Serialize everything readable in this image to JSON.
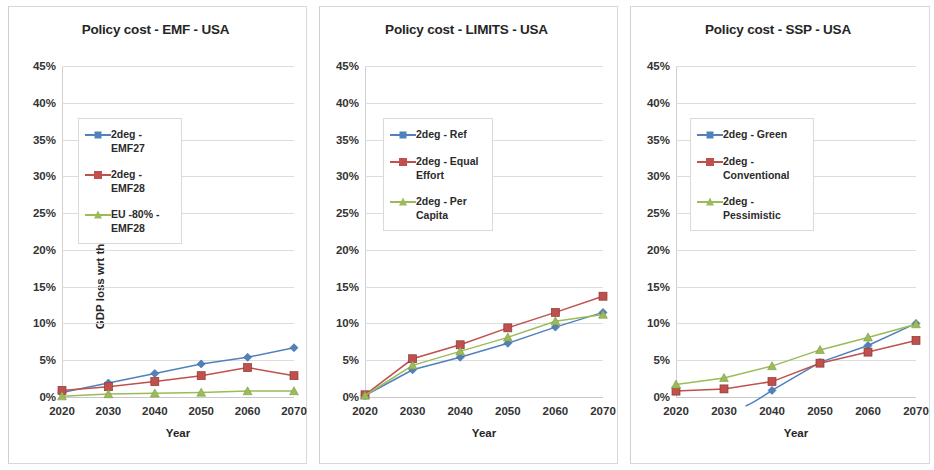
{
  "figure": {
    "panel_count": 3,
    "y_axis_title": "GDP loss wrt the relevant baseline",
    "x_axis_title": "Year",
    "colors": {
      "blue": "#4f81bd",
      "red": "#c0504d",
      "green": "#9bbb59",
      "gridline": "#dcdcdc",
      "text": "#262626"
    }
  },
  "panels": [
    {
      "title": "Policy cost - EMF - USA",
      "x_axis_title": "Year",
      "y_axis_title": "GDP loss wrt the relevant baseline",
      "y_ticks": [
        "0%",
        "5%",
        "10%",
        "15%",
        "20%",
        "25%",
        "30%",
        "35%",
        "40%",
        "45%"
      ],
      "x_ticks": [
        "2020",
        "2030",
        "2040",
        "2050",
        "2060",
        "2070"
      ],
      "legend": [
        {
          "label": "2deg - EMF27",
          "color": "#4f81bd",
          "marker": "diamond"
        },
        {
          "label": "2deg - EMF28",
          "color": "#c0504d",
          "marker": "square"
        },
        {
          "label": "EU -80% - EMF28",
          "color": "#9bbb59",
          "marker": "triangle"
        }
      ]
    },
    {
      "title": "Policy cost - LIMITS - USA",
      "x_axis_title": "Year",
      "y_ticks": [
        "0%",
        "5%",
        "10%",
        "15%",
        "20%",
        "25%",
        "30%",
        "35%",
        "40%",
        "45%"
      ],
      "x_ticks": [
        "2020",
        "2030",
        "2040",
        "2050",
        "2060",
        "2070"
      ],
      "legend": [
        {
          "label": "2deg - Ref",
          "color": "#4f81bd",
          "marker": "diamond"
        },
        {
          "label": "2deg - Equal Effort",
          "color": "#c0504d",
          "marker": "square"
        },
        {
          "label": "2deg - Per Capita",
          "color": "#9bbb59",
          "marker": "triangle"
        }
      ]
    },
    {
      "title": "Policy cost - SSP - USA",
      "x_axis_title": "Year",
      "y_ticks": [
        "0%",
        "5%",
        "10%",
        "15%",
        "20%",
        "25%",
        "30%",
        "35%",
        "40%",
        "45%"
      ],
      "x_ticks": [
        "2020",
        "2030",
        "2040",
        "2050",
        "2060",
        "2070"
      ],
      "legend": [
        {
          "label": "2deg - Green",
          "color": "#4f81bd",
          "marker": "diamond"
        },
        {
          "label": "2deg - Conventional",
          "color": "#c0504d",
          "marker": "square"
        },
        {
          "label": "2deg - Pessimistic",
          "color": "#9bbb59",
          "marker": "triangle"
        }
      ]
    }
  ],
  "chart_data": [
    {
      "type": "line",
      "title": "Policy cost - EMF - USA",
      "xlabel": "Year",
      "ylabel": "GDP loss wrt the relevant baseline",
      "x": [
        2020,
        2030,
        2040,
        2050,
        2060,
        2070
      ],
      "xlim": [
        2020,
        2070
      ],
      "ylim": [
        0,
        45
      ],
      "yticks": [
        0,
        5,
        10,
        15,
        20,
        25,
        30,
        35,
        40,
        45
      ],
      "ytick_format": "percent",
      "grid": true,
      "legend_position": "upper-left-inside",
      "series": [
        {
          "name": "2deg - EMF27",
          "color": "#4f81bd",
          "marker": "diamond",
          "values": [
            0.6,
            1.9,
            3.2,
            4.5,
            5.4,
            6.7
          ]
        },
        {
          "name": "2deg - EMF28",
          "color": "#c0504d",
          "marker": "square",
          "values": [
            0.9,
            1.4,
            2.1,
            2.9,
            4.0,
            2.9
          ]
        },
        {
          "name": "EU -80% - EMF28",
          "color": "#9bbb59",
          "marker": "triangle",
          "values": [
            0.1,
            0.4,
            0.5,
            0.6,
            0.8,
            0.8
          ]
        }
      ]
    },
    {
      "type": "line",
      "title": "Policy cost - LIMITS - USA",
      "xlabel": "Year",
      "ylabel": "GDP loss wrt the relevant baseline",
      "x": [
        2020,
        2030,
        2040,
        2050,
        2060,
        2070
      ],
      "xlim": [
        2020,
        2070
      ],
      "ylim": [
        0,
        45
      ],
      "yticks": [
        0,
        5,
        10,
        15,
        20,
        25,
        30,
        35,
        40,
        45
      ],
      "ytick_format": "percent",
      "grid": true,
      "legend_position": "upper-left-inside",
      "series": [
        {
          "name": "2deg - Ref",
          "color": "#4f81bd",
          "marker": "diamond",
          "values": [
            0.2,
            3.7,
            5.4,
            7.3,
            9.5,
            11.5
          ]
        },
        {
          "name": "2deg - Equal Effort",
          "color": "#c0504d",
          "marker": "square",
          "values": [
            0.3,
            5.2,
            7.1,
            9.4,
            11.5,
            13.7
          ]
        },
        {
          "name": "2deg - Per Capita",
          "color": "#9bbb59",
          "marker": "triangle",
          "values": [
            0.2,
            4.3,
            6.2,
            8.1,
            10.3,
            11.2
          ]
        }
      ]
    },
    {
      "type": "line",
      "title": "Policy cost - SSP - USA",
      "xlabel": "Year",
      "ylabel": "GDP loss wrt the relevant baseline",
      "x": [
        2020,
        2030,
        2040,
        2050,
        2060,
        2070
      ],
      "xlim": [
        2020,
        2070
      ],
      "ylim": [
        0,
        45
      ],
      "yticks": [
        0,
        5,
        10,
        15,
        20,
        25,
        30,
        35,
        40,
        45
      ],
      "ytick_format": "percent",
      "grid": true,
      "legend_position": "upper-left-inside",
      "series": [
        {
          "name": "2deg - Green",
          "color": "#4f81bd",
          "marker": "diamond",
          "values": [
            null,
            null,
            0.9,
            4.7,
            7.0,
            10.0
          ]
        },
        {
          "name": "2deg - Conventional",
          "color": "#c0504d",
          "marker": "square",
          "values": [
            0.8,
            1.1,
            2.1,
            4.6,
            6.1,
            7.7
          ]
        },
        {
          "name": "2deg - Pessimistic",
          "color": "#9bbb59",
          "marker": "triangle",
          "values": [
            1.7,
            2.6,
            4.2,
            6.4,
            8.1,
            9.9
          ]
        }
      ]
    }
  ]
}
